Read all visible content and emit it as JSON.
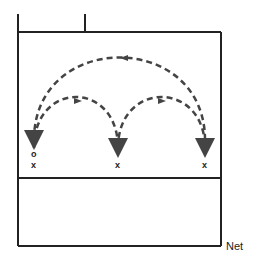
{
  "diagram": {
    "title": "",
    "net_label": "Net",
    "markers": {
      "start_circle": "o",
      "player_left": "x",
      "player_middle": "x",
      "player_right": "x"
    },
    "paths": [
      {
        "name": "left-to-middle",
        "style": "dashed",
        "direction": "left-to-right"
      },
      {
        "name": "middle-to-right",
        "style": "dashed",
        "direction": "left-to-right"
      },
      {
        "name": "right-to-left",
        "style": "dashed",
        "direction": "right-to-left"
      }
    ],
    "colors": {
      "line": "#222222",
      "arrow": "#444444"
    }
  }
}
